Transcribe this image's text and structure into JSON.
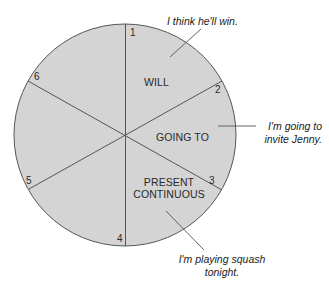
{
  "diagram": {
    "type": "circle-divided-into-segments",
    "colors": {
      "fill": "#d4d4d4",
      "stroke": "#555555",
      "text": "#2a2a2a",
      "background": "#ffffff"
    },
    "circle": {
      "cx": 125,
      "cy": 135,
      "r": 111
    },
    "segment_numbers": [
      "1",
      "2",
      "3",
      "4",
      "5",
      "6"
    ],
    "regions": {
      "will": "WILL",
      "going_to": "GOING TO",
      "present_continuous_line1": "PRESENT",
      "present_continuous_line2": "CONTINUOUS"
    },
    "examples": {
      "will": "I think he'll win.",
      "going_to_line1": "I'm going to",
      "going_to_line2": "invite Jenny.",
      "present_continuous_line1": "I'm playing squash",
      "present_continuous_line2": "tonight."
    }
  }
}
